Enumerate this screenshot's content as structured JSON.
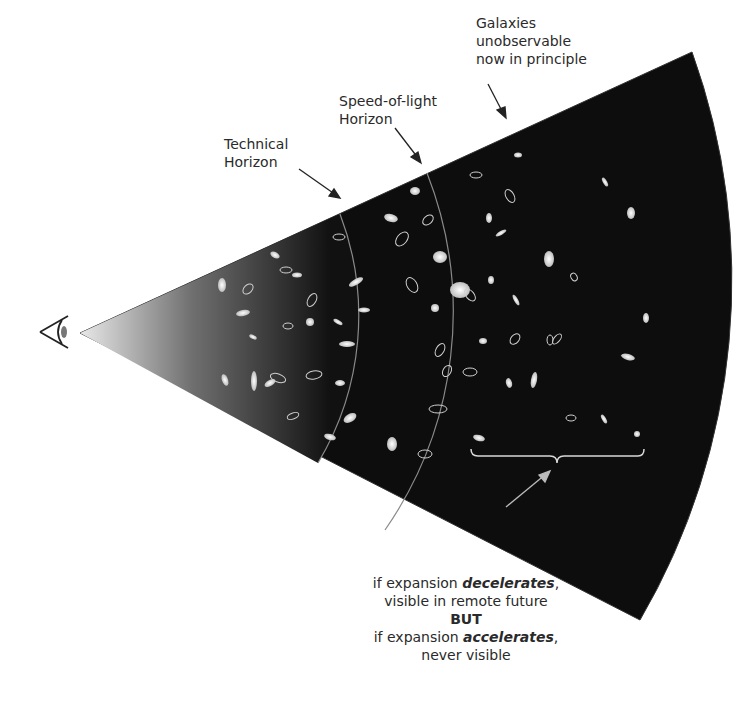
{
  "labels": {
    "galaxies_unobservable": [
      "Galaxies",
      "unobservable",
      "now in principle"
    ],
    "speed_of_light_horizon": [
      "Speed-of-light",
      "Horizon"
    ],
    "technical_horizon": [
      "Technical",
      "Horizon"
    ],
    "footnote": {
      "line1_prefix": "if expansion ",
      "line1_emph": "decelerates",
      "line1_suffix": ",",
      "line2": "visible in remote future",
      "line3": "BUT",
      "line4_prefix": "if expansion ",
      "line4_emph": "accelerates",
      "line4_suffix": ",",
      "line5": "never visible"
    }
  },
  "icons": {
    "observer": "eye-icon"
  },
  "colors": {
    "cone_dark": "#0d0d0d",
    "cone_light": "#e8e8e8",
    "boundary": "#8a8a8a",
    "text": "#2a2a2a",
    "galaxy": "#e6e6e6"
  }
}
